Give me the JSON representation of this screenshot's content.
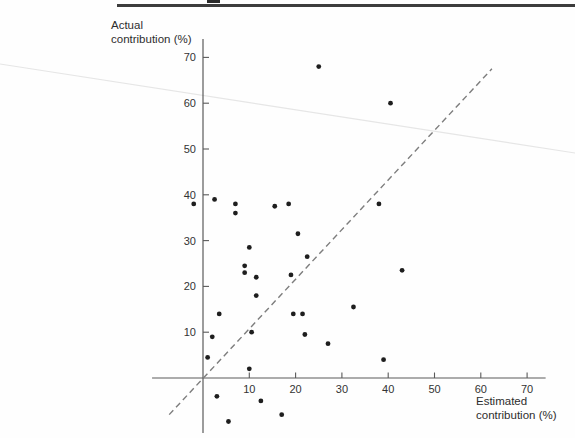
{
  "chart_data": {
    "type": "scatter",
    "title": "",
    "xlabel": "Estimated contribution (%)",
    "ylabel": "Actual contribution (%)",
    "xlabel_lines": [
      "Estimated",
      "contribution (%)"
    ],
    "ylabel_lines": [
      "Actual",
      "contribution (%)"
    ],
    "x_ticks": [
      10,
      20,
      30,
      40,
      50,
      60,
      70
    ],
    "y_ticks": [
      10,
      20,
      30,
      40,
      50,
      60,
      70
    ],
    "xlim": [
      -11,
      74
    ],
    "ylim": [
      -12,
      74
    ],
    "grid": false,
    "legend": false,
    "marker_color": "#1e1e1e",
    "axis_color": "#5a5a5a",
    "reference_line": {
      "style": "dashed",
      "color": "#7d7d7d",
      "from": [
        -7.3,
        -8.0
      ],
      "to": [
        62.4,
        67.5
      ],
      "meaning": "identity line (estimated = actual)"
    },
    "points": [
      [
        -2,
        38
      ],
      [
        2.5,
        39
      ],
      [
        7,
        38
      ],
      [
        7,
        36
      ],
      [
        15.5,
        37.5
      ],
      [
        18.5,
        38
      ],
      [
        38,
        38
      ],
      [
        25,
        68
      ],
      [
        40.5,
        60
      ],
      [
        20.5,
        31.5
      ],
      [
        10,
        28.5
      ],
      [
        22.5,
        26.5
      ],
      [
        9,
        24.5
      ],
      [
        9,
        23
      ],
      [
        11.5,
        22
      ],
      [
        19,
        22.5
      ],
      [
        43,
        23.5
      ],
      [
        11.5,
        18
      ],
      [
        3.5,
        14
      ],
      [
        19.5,
        14
      ],
      [
        21.5,
        14
      ],
      [
        32.5,
        15.5
      ],
      [
        2,
        9
      ],
      [
        10.5,
        10
      ],
      [
        22,
        9.5
      ],
      [
        27,
        7.5
      ],
      [
        1,
        4.5
      ],
      [
        10,
        2
      ],
      [
        39,
        4
      ],
      [
        3,
        -4
      ],
      [
        12.5,
        -5
      ],
      [
        17,
        -8
      ],
      [
        5.5,
        -9.5
      ]
    ]
  }
}
